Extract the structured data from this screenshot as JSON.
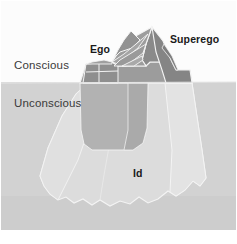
{
  "diagram": {
    "name": "freudian-iceberg-model",
    "labels": {
      "conscious": "Conscious",
      "unconscious": "Unconscious",
      "ego": "Ego",
      "superego": "Superego",
      "id": "Id"
    },
    "colors": {
      "background": "#fdfdfd",
      "sky": "#fcfcfc",
      "water": "#d2d2d2",
      "water_deep": "#cdcdcd",
      "iceberg_submerged": "#dcdcdc",
      "iceberg_submerged_light": "#e2e2e2",
      "iceberg_above_dark": "#8d8d8d",
      "iceberg_above_mid": "#9a9a9a",
      "iceberg_above_light": "#a8a8a8",
      "ego_block": "#b0b0b0",
      "outline": "#f2f2f2",
      "label_region": "#3a3a3a",
      "label_structure": "#1a1a1a"
    },
    "geometry": {
      "waterline_y": 82,
      "apex": [
        152,
        27
      ],
      "canvas": [
        237,
        244
      ]
    }
  }
}
